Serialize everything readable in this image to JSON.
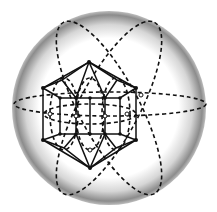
{
  "diagram": {
    "title": "",
    "colors": {
      "background": "#ffffff",
      "sphere_shade": "#8a8a8a",
      "lines": "#111111"
    },
    "sphere": {
      "cx": 109,
      "cy": 108,
      "r": 97
    },
    "labels": []
  }
}
